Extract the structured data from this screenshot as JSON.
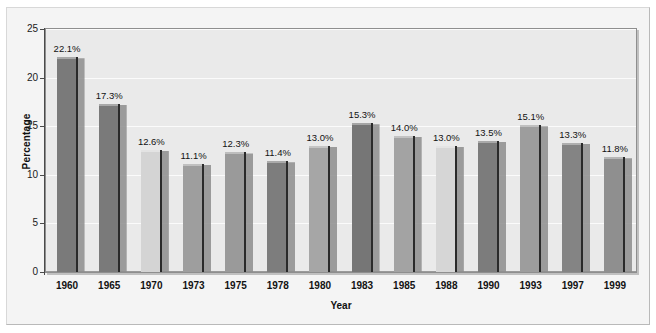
{
  "chart_data": {
    "type": "bar",
    "title": "",
    "xlabel": "Year",
    "ylabel": "Percentage",
    "categories": [
      "1960",
      "1965",
      "1970",
      "1973",
      "1975",
      "1978",
      "1980",
      "1983",
      "1985",
      "1988",
      "1990",
      "1993",
      "1997",
      "1999"
    ],
    "values": [
      22.1,
      17.3,
      12.6,
      11.1,
      12.3,
      11.4,
      13.0,
      15.3,
      14.0,
      13.0,
      13.5,
      15.1,
      13.3,
      11.8
    ],
    "data_labels": [
      "22.1%",
      "17.3%",
      "12.6%",
      "11.1%",
      "12.3%",
      "11.4%",
      "13.0%",
      "15.3%",
      "14.0%",
      "13.0%",
      "13.5%",
      "15.1%",
      "13.3%",
      "11.8%"
    ],
    "bar_colors": [
      "#7a7a7a",
      "#7a7a7a",
      "#d4d4d4",
      "#9e9e9e",
      "#9a9a9a",
      "#7d7d7d",
      "#a6a6a6",
      "#767676",
      "#a3a3a3",
      "#d6d6d6",
      "#7c7c7c",
      "#9d9d9d",
      "#848484",
      "#8f8f8f"
    ],
    "ylim": [
      0,
      25
    ],
    "yticks": [
      0,
      5,
      10,
      15,
      20,
      25
    ],
    "ytick_labels": [
      "0",
      "5",
      "10",
      "15",
      "20",
      "25"
    ],
    "grid": true,
    "grid_color": "#fbfbfb",
    "legend": false,
    "plot_background": "#eaeaea",
    "frame_background": "#f4f4f4",
    "axis_color": "#4a4a4a"
  }
}
